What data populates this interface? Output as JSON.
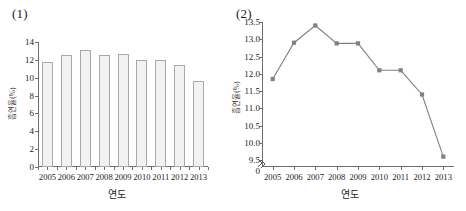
{
  "figure": {
    "panel_1_tag": "(1)",
    "panel_2_tag": "(2)"
  },
  "chart_data": [
    {
      "id": "panel-1",
      "type": "bar",
      "title": "(1)",
      "xlabel": "연도",
      "ylabel": "흡연율(%)",
      "categories": [
        "2005",
        "2006",
        "2007",
        "2008",
        "2009",
        "2010",
        "2011",
        "2012",
        "2013"
      ],
      "values": [
        11.8,
        12.6,
        13.1,
        12.6,
        12.65,
        12.0,
        12.0,
        11.4,
        9.6
      ],
      "ylim": [
        0,
        14
      ],
      "yticks": [
        "0",
        "2",
        "4",
        "6",
        "8",
        "10",
        "12",
        "14"
      ],
      "ytick_values": [
        0,
        2,
        4,
        6,
        8,
        10,
        12,
        14
      ],
      "grid": false,
      "legend": "none",
      "bar_fill": "#f2f2f2",
      "bar_stroke": "#a8a8a8",
      "axis_color": "#6f6f6f"
    },
    {
      "id": "panel-2",
      "type": "line",
      "title": "(2)",
      "xlabel": "연도",
      "ylabel": "흡연율(%)",
      "categories": [
        "2005",
        "2006",
        "2007",
        "2008",
        "2009",
        "2010",
        "2011",
        "2012",
        "2013"
      ],
      "values": [
        11.85,
        12.9,
        13.4,
        12.88,
        12.88,
        12.1,
        12.1,
        11.4,
        9.6
      ],
      "ylim": [
        9.3,
        13.5
      ],
      "yticks": [
        "0",
        "9.5",
        "10.0",
        "10.5",
        "11.0",
        "11.5",
        "12.0",
        "12.5",
        "13.0",
        "13.5"
      ],
      "ytick_values": [
        9.5,
        10.0,
        10.5,
        11.0,
        11.5,
        12.0,
        12.5,
        13.0,
        13.5
      ],
      "axis_break": true,
      "axis_break_label": "0",
      "grid": false,
      "legend": "none",
      "line_color": "#808080",
      "marker_color": "#808080",
      "axis_color": "#6f6f6f"
    }
  ]
}
